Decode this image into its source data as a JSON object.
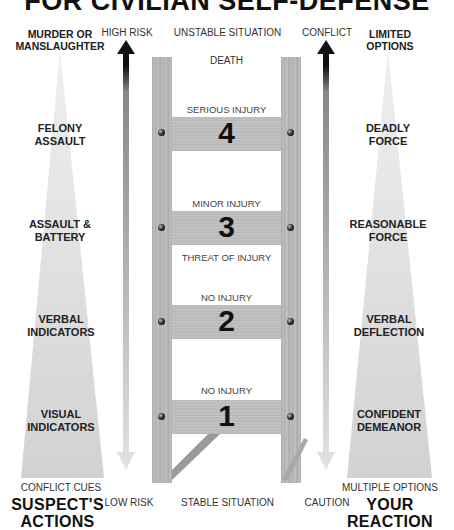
{
  "title": "FOR CIVILIAN SELF-DEFENSE",
  "left_column": {
    "top_label": "MURDER OR MANSLAUGHTER",
    "levels": [
      {
        "label": "FELONY ASSAULT"
      },
      {
        "label": "ASSAULT & BATTERY"
      },
      {
        "label": "VERBAL INDICATORS"
      },
      {
        "label": "VISUAL INDICATORS"
      }
    ],
    "bottom_label": "CONFLICT CUES",
    "heading": "SUSPECT'S ACTIONS"
  },
  "left_arrow": {
    "top_label": "HIGH RISK",
    "bottom_label": "LOW RISK"
  },
  "ladder": {
    "top_label": "UNSTABLE SITUATION",
    "bottom_label": "STABLE SITUATION",
    "rungs": [
      {
        "number": "4",
        "above_label": "SERIOUS INJURY",
        "top_label": "DEATH"
      },
      {
        "number": "3",
        "above_label": "MINOR INJURY",
        "top_label": ""
      },
      {
        "number": "2",
        "above_label": "NO INJURY",
        "top_label": "THREAT OF INJURY"
      },
      {
        "number": "1",
        "above_label": "NO INJURY",
        "top_label": ""
      }
    ]
  },
  "right_arrow": {
    "top_label": "CONFLICT",
    "bottom_label": "CAUTION"
  },
  "right_column": {
    "top_label": "LIMITED OPTIONS",
    "levels": [
      {
        "label": "DEADLY FORCE"
      },
      {
        "label": "REASONABLE FORCE"
      },
      {
        "label": "VERBAL DEFLECTION"
      },
      {
        "label": "CONFIDENT DEMEANOR"
      }
    ],
    "bottom_label": "MULTIPLE OPTIONS",
    "heading": "YOUR REACTION"
  },
  "colors": {
    "triangle": "#d6d6d6",
    "arrow_dark": "#111111",
    "arrow_light": "#d0d0d0",
    "wood": "#b8b8b8"
  }
}
